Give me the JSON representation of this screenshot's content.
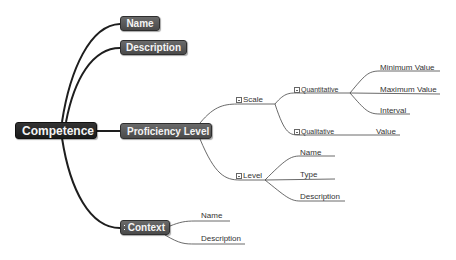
{
  "mindmap": {
    "root": {
      "label": "Competence"
    },
    "branches": {
      "name": {
        "label": "Name"
      },
      "description": {
        "label": "Description"
      },
      "proficiency": {
        "label": "Proficiency Level"
      },
      "context": {
        "label": "Context"
      }
    },
    "proficiency": {
      "scale": {
        "label": "Scale"
      },
      "level": {
        "label": "Level"
      }
    },
    "scale": {
      "quantitative": {
        "label": "Quantitative"
      },
      "qualitative": {
        "label": "Qualitative"
      }
    },
    "quantitative": {
      "min": {
        "label": "Minimum Value"
      },
      "max": {
        "label": "Maximum Value"
      },
      "interval": {
        "label": "Interval"
      }
    },
    "qualitative": {
      "value": {
        "label": "Value"
      }
    },
    "level": {
      "name": {
        "label": "Name"
      },
      "type": {
        "label": "Type"
      },
      "description": {
        "label": "Description"
      }
    },
    "context": {
      "name": {
        "label": "Name"
      },
      "description": {
        "label": "Description"
      }
    }
  },
  "colors": {
    "root_fill": "#222222",
    "node_fill": "#555555",
    "link": "#222222",
    "thin_link": "#555555"
  }
}
